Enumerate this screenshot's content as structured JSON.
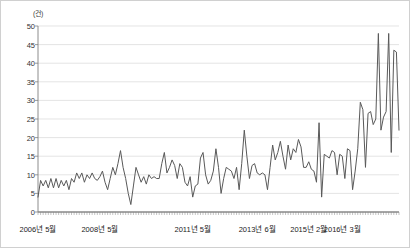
{
  "chart_data": {
    "type": "line",
    "title": "",
    "subtitle": "",
    "xlabel": "",
    "ylabel": "",
    "unit_label": "(건)",
    "ylim": [
      0,
      50
    ],
    "ytick_step": 5,
    "yticks": [
      0,
      5,
      10,
      15,
      20,
      25,
      30,
      35,
      40,
      45,
      50
    ],
    "grid": "horizontal",
    "legend": "none",
    "line_color": "#595959",
    "gridline_color": "#d9d9d9",
    "axis_color": "#808080",
    "background": "#ffffff",
    "x_start": "2006년 5월",
    "x_end": "2016년 3월",
    "xtick_labels": [
      {
        "label": "2006년 5월",
        "index": 0
      },
      {
        "label": "2008년 5월",
        "index": 24
      },
      {
        "label": "2011년 5월",
        "index": 60
      },
      {
        "label": "2013년 6월",
        "index": 85
      },
      {
        "label": "2015년 2월",
        "index": 105
      },
      {
        "label": "2016년 3월",
        "index": 118
      }
    ],
    "series": [
      {
        "name": "월별 건수",
        "values": [
          4,
          8.5,
          7,
          8.5,
          6.5,
          9,
          6.5,
          9,
          6.5,
          8.5,
          7,
          8.5,
          6,
          9,
          8,
          10.5,
          9,
          10.5,
          8,
          10,
          9,
          10.5,
          9,
          8.5,
          9.5,
          11,
          8,
          6,
          9,
          12,
          10,
          13,
          16.5,
          12,
          9,
          5,
          2,
          7,
          12,
          10,
          8,
          9.5,
          7.5,
          10,
          9,
          9.5,
          9,
          9,
          13,
          16,
          10.5,
          12,
          14,
          12.5,
          9,
          13,
          12,
          8,
          7,
          9.5,
          4,
          7,
          7.5,
          14.5,
          16,
          10,
          7.5,
          8.5,
          11,
          17,
          12,
          5,
          9,
          12,
          11.5,
          11,
          9,
          12,
          6,
          13,
          22,
          15,
          9,
          12.5,
          13,
          10.5,
          10,
          10.5,
          10,
          6,
          12,
          18,
          14,
          16,
          19,
          15,
          11.5,
          18,
          14,
          17,
          16,
          19.5,
          17.5,
          12,
          12,
          13.5,
          11.5,
          11,
          8,
          24,
          4,
          15.5,
          15,
          14.5,
          16.5,
          16,
          10,
          15.5,
          15,
          9,
          17,
          16.5,
          6,
          11,
          17,
          29.5,
          27.5,
          12,
          26.5,
          27,
          23.5,
          25,
          48,
          22,
          25.5,
          27,
          48,
          16,
          43.5,
          43,
          22
        ]
      }
    ]
  },
  "plot_geometry": {
    "left": 37,
    "right": 398,
    "top": 25,
    "bottom": 211
  }
}
